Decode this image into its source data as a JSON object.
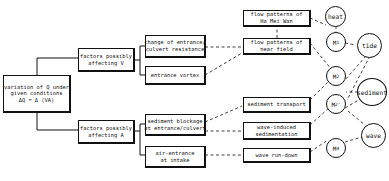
{
  "diagram": {
    "root": {
      "lines": [
        "variation of Q under",
        "given conditions",
        "ΔQ = Δ (VA)"
      ]
    },
    "factors": [
      {
        "id": "v",
        "lines": [
          "factors possibly",
          "affecting V"
        ]
      },
      {
        "id": "a",
        "lines": [
          "factors possibly",
          "affecting A"
        ]
      }
    ],
    "causes": [
      {
        "id": "c1",
        "lines": [
          "change of entrance/",
          "culvert resistance"
        ]
      },
      {
        "id": "c2",
        "lines": [
          "entrance vortex"
        ]
      },
      {
        "id": "c3",
        "lines": [
          "sediment blockage",
          "at entrance/culvert"
        ]
      },
      {
        "id": "c4",
        "lines": [
          "air-entrance",
          "at intake"
        ]
      }
    ],
    "processes": [
      {
        "id": "p1",
        "lines": [
          "flow patterns of",
          "Ha Mei Wan"
        ]
      },
      {
        "id": "p2",
        "lines": [
          "flow patterns of",
          "near field"
        ]
      },
      {
        "id": "p3",
        "lines": [
          "sediment transport"
        ]
      },
      {
        "id": "p4",
        "lines": [
          "wave-induced",
          "sedimentation"
        ]
      },
      {
        "id": "p5",
        "lines": [
          "wave run-down"
        ]
      }
    ],
    "models": [
      {
        "id": "m1",
        "label": "M",
        "sub": "1"
      },
      {
        "id": "m2",
        "label": "M",
        "sub": "2"
      },
      {
        "id": "m2p",
        "label": "M",
        "sub": "2'"
      },
      {
        "id": "m4",
        "label": "M",
        "sub": "4"
      }
    ],
    "drivers": [
      {
        "id": "heat",
        "label": "heat"
      },
      {
        "id": "tide",
        "label": "tide"
      },
      {
        "id": "sediment",
        "label": "sediment"
      },
      {
        "id": "wave",
        "label": "wave"
      }
    ]
  }
}
